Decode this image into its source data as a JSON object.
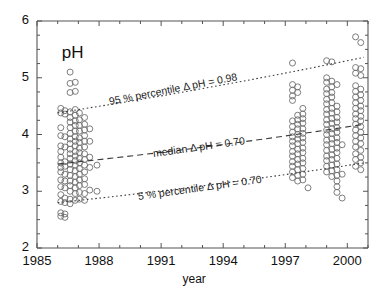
{
  "figure": {
    "title_label": "pH",
    "xaxis_title": "year"
  },
  "chart_data": {
    "type": "scatter",
    "title": "pH",
    "xlabel": "year",
    "ylabel": "pH",
    "xlim": [
      1985,
      2001
    ],
    "ylim": [
      2,
      6
    ],
    "grid": false,
    "legend": "none",
    "x_ticks_major": [
      "1985",
      "1988",
      "1991",
      "1994",
      "1997",
      "2000"
    ],
    "x_ticks_major_values": [
      1985,
      1988,
      1991,
      1994,
      1997,
      2000
    ],
    "x_minor_tick_interval": 1,
    "y_ticks_major": [
      "2",
      "3",
      "4",
      "5",
      "6"
    ],
    "y_ticks_major_values": [
      2,
      3,
      4,
      5,
      6
    ],
    "y_minor_tick_interval": 0.25,
    "marker": {
      "shape": "open-circle",
      "size_px": 6,
      "stroke": "#6e6e6e",
      "fill": "none"
    },
    "series": [
      {
        "name": "pH observations",
        "points": [
          [
            1986.15,
            4.46
          ],
          [
            1986.15,
            4.38
          ],
          [
            1986.15,
            4.12
          ],
          [
            1986.15,
            3.98
          ],
          [
            1986.15,
            3.8
          ],
          [
            1986.15,
            3.7
          ],
          [
            1986.15,
            3.6
          ],
          [
            1986.15,
            3.5
          ],
          [
            1986.15,
            3.42
          ],
          [
            1986.15,
            3.34
          ],
          [
            1986.15,
            3.2
          ],
          [
            1986.15,
            3.08
          ],
          [
            1986.15,
            2.94
          ],
          [
            1986.15,
            2.82
          ],
          [
            1986.15,
            2.62
          ],
          [
            1986.15,
            2.56
          ],
          [
            1986.35,
            4.42
          ],
          [
            1986.35,
            4.36
          ],
          [
            1986.35,
            3.96
          ],
          [
            1986.35,
            3.78
          ],
          [
            1986.35,
            3.52
          ],
          [
            1986.35,
            3.44
          ],
          [
            1986.35,
            3.3
          ],
          [
            1986.35,
            3.18
          ],
          [
            1986.35,
            3.06
          ],
          [
            1986.35,
            2.88
          ],
          [
            1986.35,
            2.8
          ],
          [
            1986.35,
            2.6
          ],
          [
            1986.35,
            2.54
          ],
          [
            1986.6,
            5.1
          ],
          [
            1986.6,
            4.9
          ],
          [
            1986.6,
            4.74
          ],
          [
            1986.6,
            4.4
          ],
          [
            1986.6,
            4.3
          ],
          [
            1986.6,
            4.22
          ],
          [
            1986.6,
            4.12
          ],
          [
            1986.6,
            4.02
          ],
          [
            1986.6,
            3.92
          ],
          [
            1986.6,
            3.84
          ],
          [
            1986.6,
            3.74
          ],
          [
            1986.6,
            3.66
          ],
          [
            1986.6,
            3.58
          ],
          [
            1986.6,
            3.48
          ],
          [
            1986.6,
            3.38
          ],
          [
            1986.6,
            3.28
          ],
          [
            1986.6,
            3.18
          ],
          [
            1986.6,
            3.1
          ],
          [
            1986.6,
            3.0
          ],
          [
            1986.6,
            2.86
          ],
          [
            1986.6,
            2.78
          ],
          [
            1986.85,
            4.92
          ],
          [
            1986.85,
            4.76
          ],
          [
            1986.85,
            4.44
          ],
          [
            1986.85,
            4.34
          ],
          [
            1986.85,
            4.24
          ],
          [
            1986.85,
            4.16
          ],
          [
            1986.85,
            4.06
          ],
          [
            1986.85,
            3.96
          ],
          [
            1986.85,
            3.88
          ],
          [
            1986.85,
            3.8
          ],
          [
            1986.85,
            3.7
          ],
          [
            1986.85,
            3.62
          ],
          [
            1986.85,
            3.54
          ],
          [
            1986.85,
            3.46
          ],
          [
            1986.85,
            3.36
          ],
          [
            1986.85,
            3.26
          ],
          [
            1986.85,
            3.16
          ],
          [
            1986.85,
            3.06
          ],
          [
            1986.85,
            2.96
          ],
          [
            1986.85,
            2.84
          ],
          [
            1987.05,
            4.38
          ],
          [
            1987.05,
            4.26
          ],
          [
            1987.05,
            4.16
          ],
          [
            1987.05,
            4.06
          ],
          [
            1987.05,
            3.94
          ],
          [
            1987.05,
            3.86
          ],
          [
            1987.05,
            3.76
          ],
          [
            1987.05,
            3.68
          ],
          [
            1987.05,
            3.58
          ],
          [
            1987.05,
            3.5
          ],
          [
            1987.05,
            3.4
          ],
          [
            1987.05,
            3.3
          ],
          [
            1987.05,
            3.2
          ],
          [
            1987.05,
            3.1
          ],
          [
            1987.05,
            2.98
          ],
          [
            1987.05,
            2.86
          ],
          [
            1987.3,
            4.3
          ],
          [
            1987.3,
            4.18
          ],
          [
            1987.3,
            4.08
          ],
          [
            1987.3,
            3.98
          ],
          [
            1987.3,
            3.88
          ],
          [
            1987.3,
            3.78
          ],
          [
            1987.3,
            3.66
          ],
          [
            1987.3,
            3.56
          ],
          [
            1987.3,
            3.46
          ],
          [
            1987.3,
            3.34
          ],
          [
            1987.3,
            3.22
          ],
          [
            1987.3,
            3.12
          ],
          [
            1987.3,
            2.96
          ],
          [
            1987.3,
            2.84
          ],
          [
            1987.55,
            4.1
          ],
          [
            1987.55,
            3.88
          ],
          [
            1987.55,
            3.6
          ],
          [
            1987.55,
            3.42
          ],
          [
            1987.55,
            3.02
          ],
          [
            1987.9,
            3.46
          ],
          [
            1987.9,
            3.0
          ],
          [
            1997.35,
            5.26
          ],
          [
            1997.35,
            4.88
          ],
          [
            1997.35,
            4.78
          ],
          [
            1997.35,
            4.68
          ],
          [
            1997.35,
            4.6
          ],
          [
            1997.35,
            4.24
          ],
          [
            1997.35,
            4.14
          ],
          [
            1997.35,
            4.04
          ],
          [
            1997.35,
            3.96
          ],
          [
            1997.35,
            3.88
          ],
          [
            1997.35,
            3.8
          ],
          [
            1997.35,
            3.7
          ],
          [
            1997.35,
            3.62
          ],
          [
            1997.35,
            3.52
          ],
          [
            1997.35,
            3.44
          ],
          [
            1997.35,
            3.34
          ],
          [
            1997.35,
            3.24
          ],
          [
            1997.6,
            4.84
          ],
          [
            1997.6,
            4.74
          ],
          [
            1997.6,
            4.34
          ],
          [
            1997.6,
            4.26
          ],
          [
            1997.6,
            4.18
          ],
          [
            1997.6,
            4.1
          ],
          [
            1997.6,
            4.0
          ],
          [
            1997.6,
            3.92
          ],
          [
            1997.6,
            3.84
          ],
          [
            1997.6,
            3.74
          ],
          [
            1997.6,
            3.66
          ],
          [
            1997.6,
            3.56
          ],
          [
            1997.6,
            3.48
          ],
          [
            1997.6,
            3.38
          ],
          [
            1997.6,
            3.28
          ],
          [
            1997.6,
            3.18
          ],
          [
            1997.85,
            4.46
          ],
          [
            1997.85,
            4.36
          ],
          [
            1997.85,
            4.28
          ],
          [
            1997.85,
            4.2
          ],
          [
            1997.85,
            4.1
          ],
          [
            1997.85,
            4.02
          ],
          [
            1997.85,
            3.94
          ],
          [
            1997.85,
            3.86
          ],
          [
            1997.85,
            3.76
          ],
          [
            1997.85,
            3.68
          ],
          [
            1997.85,
            3.58
          ],
          [
            1997.85,
            3.5
          ],
          [
            1997.85,
            3.4
          ],
          [
            1997.85,
            3.3
          ],
          [
            1997.85,
            3.2
          ],
          [
            1998.1,
            3.06
          ],
          [
            1999.0,
            5.3
          ],
          [
            1999.0,
            5.0
          ],
          [
            1999.0,
            4.92
          ],
          [
            1999.0,
            4.8
          ],
          [
            1999.0,
            4.72
          ],
          [
            1999.0,
            4.62
          ],
          [
            1999.0,
            4.54
          ],
          [
            1999.0,
            4.44
          ],
          [
            1999.0,
            4.36
          ],
          [
            1999.0,
            4.26
          ],
          [
            1999.0,
            4.18
          ],
          [
            1999.0,
            4.08
          ],
          [
            1999.0,
            4.0
          ],
          [
            1999.0,
            3.9
          ],
          [
            1999.0,
            3.82
          ],
          [
            1999.0,
            3.72
          ],
          [
            1999.0,
            3.62
          ],
          [
            1999.0,
            3.54
          ],
          [
            1999.0,
            3.44
          ],
          [
            1999.0,
            3.34
          ],
          [
            1999.25,
            5.28
          ],
          [
            1999.25,
            4.94
          ],
          [
            1999.25,
            4.84
          ],
          [
            1999.25,
            4.74
          ],
          [
            1999.25,
            4.66
          ],
          [
            1999.25,
            4.56
          ],
          [
            1999.25,
            4.46
          ],
          [
            1999.25,
            4.38
          ],
          [
            1999.25,
            4.28
          ],
          [
            1999.25,
            4.2
          ],
          [
            1999.25,
            4.1
          ],
          [
            1999.25,
            4.02
          ],
          [
            1999.25,
            3.92
          ],
          [
            1999.25,
            3.84
          ],
          [
            1999.25,
            3.74
          ],
          [
            1999.25,
            3.64
          ],
          [
            1999.25,
            3.56
          ],
          [
            1999.25,
            3.46
          ],
          [
            1999.25,
            3.36
          ],
          [
            1999.25,
            3.26
          ],
          [
            1999.5,
            4.88
          ],
          [
            1999.5,
            4.5
          ],
          [
            1999.5,
            4.4
          ],
          [
            1999.5,
            4.3
          ],
          [
            1999.5,
            4.22
          ],
          [
            1999.5,
            4.12
          ],
          [
            1999.5,
            4.04
          ],
          [
            1999.5,
            3.94
          ],
          [
            1999.5,
            3.86
          ],
          [
            1999.5,
            3.76
          ],
          [
            1999.5,
            3.68
          ],
          [
            1999.5,
            3.58
          ],
          [
            1999.5,
            3.48
          ],
          [
            1999.5,
            3.38
          ],
          [
            1999.5,
            3.28
          ],
          [
            1999.5,
            3.18
          ],
          [
            1999.5,
            3.08
          ],
          [
            1999.5,
            2.98
          ],
          [
            1999.75,
            3.82
          ],
          [
            1999.75,
            3.3
          ],
          [
            1999.75,
            2.88
          ],
          [
            2000.4,
            5.72
          ],
          [
            2000.4,
            5.18
          ],
          [
            2000.4,
            5.08
          ],
          [
            2000.4,
            4.86
          ],
          [
            2000.4,
            4.76
          ],
          [
            2000.4,
            4.66
          ],
          [
            2000.4,
            4.56
          ],
          [
            2000.4,
            4.46
          ],
          [
            2000.4,
            4.36
          ],
          [
            2000.4,
            4.28
          ],
          [
            2000.4,
            4.18
          ],
          [
            2000.4,
            4.08
          ],
          [
            2000.4,
            3.98
          ],
          [
            2000.4,
            3.88
          ],
          [
            2000.4,
            3.78
          ],
          [
            2000.4,
            3.66
          ],
          [
            2000.4,
            3.56
          ],
          [
            2000.4,
            3.44
          ],
          [
            2000.65,
            5.62
          ],
          [
            2000.65,
            5.16
          ],
          [
            2000.65,
            5.04
          ],
          [
            2000.65,
            4.8
          ],
          [
            2000.65,
            4.7
          ],
          [
            2000.65,
            4.6
          ],
          [
            2000.65,
            4.5
          ],
          [
            2000.65,
            4.42
          ],
          [
            2000.65,
            4.32
          ],
          [
            2000.65,
            4.24
          ],
          [
            2000.65,
            4.14
          ],
          [
            2000.65,
            4.04
          ],
          [
            2000.65,
            3.94
          ],
          [
            2000.65,
            3.84
          ],
          [
            2000.65,
            3.72
          ],
          [
            2000.65,
            3.6
          ],
          [
            2000.65,
            3.5
          ],
          [
            2000.65,
            3.38
          ]
        ]
      }
    ],
    "trend_lines": [
      {
        "name": "95 % percentile",
        "label": "95 % percentile Δ pH = 0.98",
        "style": "dotted",
        "delta_pH": 0.98,
        "start": [
          1986.0,
          4.38
        ],
        "end": [
          2000.8,
          5.36
        ]
      },
      {
        "name": "median",
        "label": "median Δ pH = 0.70",
        "style": "dashed",
        "delta_pH": 0.7,
        "start": [
          1986.0,
          3.48
        ],
        "end": [
          2000.8,
          4.18
        ]
      },
      {
        "name": "5 % percentile",
        "label": "5 % percentile Δ pH = 0.70",
        "style": "dotted",
        "delta_pH": 0.7,
        "start": [
          1986.0,
          2.8
        ],
        "end": [
          2000.8,
          3.5
        ]
      }
    ]
  },
  "annotations": {
    "line_95": "95 % percentile Δ pH = 0.98",
    "line_median": "median Δ pH = 0.70",
    "line_05": "5 % percentile Δ pH = 0.70"
  },
  "axes": {
    "y_labels": [
      "6",
      "5",
      "4",
      "3",
      "2"
    ],
    "x_labels": [
      "1985",
      "1988",
      "1991",
      "1994",
      "1997",
      "2000"
    ]
  },
  "colors": {
    "axis": "#555555",
    "marker_stroke": "#6e6e6e",
    "trend": "#3a3a3a",
    "text": "#111111",
    "background": "#ffffff"
  }
}
